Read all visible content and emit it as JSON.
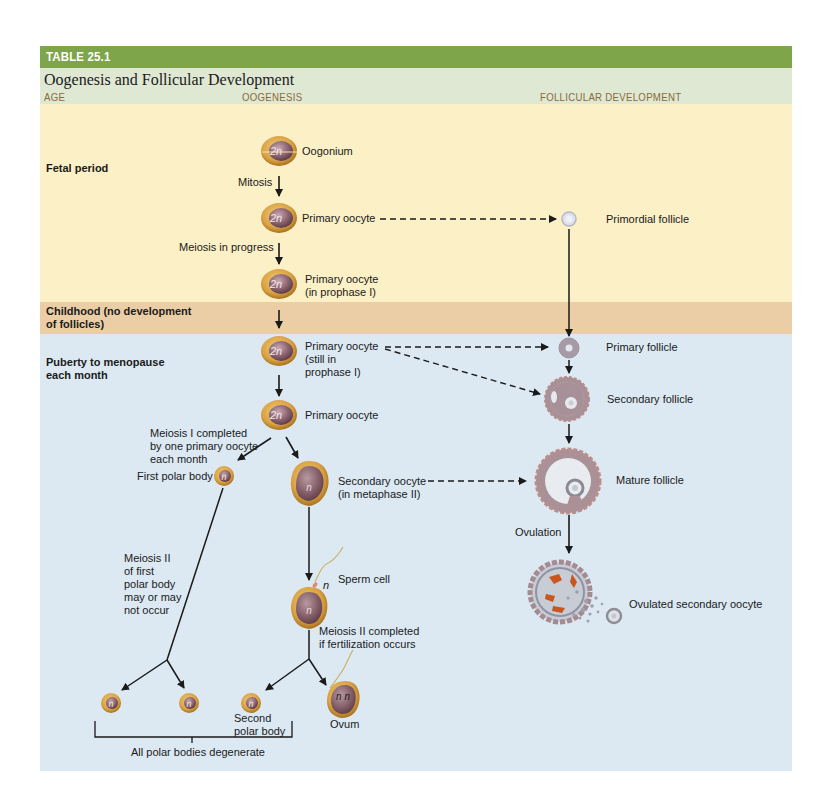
{
  "table": {
    "number": "TABLE 25.1",
    "title": "Oogenesis and Follicular Development",
    "columns": [
      "AGE",
      "OOGENESIS",
      "FOLLICULAR DEVELOPMENT"
    ]
  },
  "ages": [
    {
      "label": "Fetal period"
    },
    {
      "label_line1": "Childhood (no development",
      "label_line2": "of follicles)"
    },
    {
      "label_line1": "Puberty to menopause",
      "label_line2": "each month"
    }
  ],
  "oogenesis": {
    "cells": [
      {
        "label": "Oogonium",
        "ploidy": "2n"
      },
      {
        "label": "Primary oocyte",
        "ploidy": "2n"
      },
      {
        "label_line1": "Primary oocyte",
        "label_line2": "(in prophase I)",
        "ploidy": "2n"
      },
      {
        "label_line1": "Primary oocyte",
        "label_line2": "(still in",
        "label_line3": "prophase I)",
        "ploidy": "2n"
      },
      {
        "label": "Primary oocyte",
        "ploidy": "2n"
      },
      {
        "label": "First polar body",
        "ploidy": "n"
      },
      {
        "label_line1": "Secondary oocyte",
        "label_line2": "(in metaphase II)",
        "ploidy": "n"
      },
      {
        "label": "Sperm cell",
        "ploidy": "n"
      },
      {
        "label_line1": "Second",
        "label_line2": "polar body",
        "ploidy": "n"
      },
      {
        "label": "Ovum",
        "ploidy": "n n"
      }
    ],
    "processes": {
      "mitosis": "Mitosis",
      "meiosis_progress": "Meiosis in progress",
      "meiosis1_line1": "Meiosis I completed",
      "meiosis1_line2": "by one primary oocyte",
      "meiosis1_line3": "each month",
      "meiosis2_polar_line1": "Meiosis II",
      "meiosis2_polar_line2": "of first",
      "meiosis2_polar_line3": "polar body",
      "meiosis2_polar_line4": "may or may",
      "meiosis2_polar_line5": "not occur",
      "meiosis2_line1": "Meiosis II completed",
      "meiosis2_line2": "if fertilization occurs",
      "degenerate": "All polar bodies degenerate"
    }
  },
  "follicles": [
    {
      "label": "Primordial follicle"
    },
    {
      "label": "Primary follicle"
    },
    {
      "label": "Secondary follicle"
    },
    {
      "label": "Mature follicle"
    },
    {
      "label": "Ovulated secondary oocyte"
    }
  ],
  "ovulation_label": "Ovulation",
  "colors": {
    "title_band": "#7ea54a",
    "header_band": "#dfe8d3",
    "fetal_band": "#fbf0c6",
    "childhood_band": "#ebcea6",
    "puberty_band": "#dce9f3",
    "column_header_text": "#8a6a3a"
  }
}
